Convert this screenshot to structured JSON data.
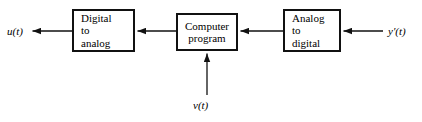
{
  "diagram": {
    "type": "block-diagram",
    "background": "#ffffff",
    "stroke": "#111111",
    "blocks": [
      {
        "id": "dac",
        "name": "digital-to-analog-block",
        "lines": [
          "Digital",
          "to",
          "analog"
        ],
        "align": "left",
        "x": 72,
        "y": 9,
        "w": 63,
        "h": 43
      },
      {
        "id": "cpu",
        "name": "computer-program-block",
        "lines": [
          "Computer",
          "program"
        ],
        "align": "center",
        "x": 176,
        "y": 13,
        "w": 62,
        "h": 38
      },
      {
        "id": "adc",
        "name": "analog-to-digital-block",
        "lines": [
          "Analog",
          "to",
          "digital"
        ],
        "align": "left",
        "x": 283,
        "y": 9,
        "w": 58,
        "h": 43
      }
    ],
    "signals": [
      {
        "id": "u",
        "name": "output-signal-u",
        "base": "u",
        "prime": "",
        "arg": "(t)",
        "text": "u(t)",
        "x": 7,
        "y": 25
      },
      {
        "id": "yprime",
        "name": "input-signal-y-prime",
        "base": "y",
        "prime": "′",
        "arg": "(t)",
        "text": "y′(t)",
        "x": 388,
        "y": 25
      },
      {
        "id": "v",
        "name": "reference-signal-v",
        "base": "v",
        "prime": "",
        "arg": "(t)",
        "text": "v(t)",
        "x": 193,
        "y": 99
      }
    ],
    "arrows": [
      {
        "id": "arrow-adc-to-cpu",
        "name": "arrow-adc-to-cpu",
        "from": [
          283,
          31
        ],
        "to": [
          239,
          31
        ],
        "direction": "left"
      },
      {
        "id": "arrow-cpu-to-dac",
        "name": "arrow-cpu-to-dac",
        "from": [
          176,
          31
        ],
        "to": [
          136,
          31
        ],
        "direction": "left"
      },
      {
        "id": "arrow-dac-to-u",
        "name": "arrow-dac-to-output",
        "from": [
          72,
          31
        ],
        "to": [
          31,
          31
        ],
        "direction": "left"
      },
      {
        "id": "arrow-yprime-to-adc",
        "name": "arrow-input-to-adc",
        "from": [
          383,
          31
        ],
        "to": [
          342,
          31
        ],
        "direction": "left"
      },
      {
        "id": "arrow-v-to-cpu",
        "name": "arrow-reference-to-cpu",
        "from": [
          207,
          95
        ],
        "to": [
          207,
          52
        ],
        "direction": "up"
      }
    ]
  }
}
